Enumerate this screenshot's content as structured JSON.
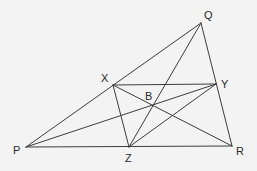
{
  "diagram": {
    "type": "geometry",
    "background": "#f3f3f3",
    "line_color": "#3c3c3c",
    "points": {
      "P": {
        "label": "P",
        "x": 26,
        "y": 147,
        "label_x": 13,
        "label_y": 145
      },
      "Q": {
        "label": "Q",
        "x": 201,
        "y": 23,
        "label_x": 204,
        "label_y": 10
      },
      "R": {
        "label": "R",
        "x": 232,
        "y": 146,
        "label_x": 236,
        "label_y": 146
      },
      "X": {
        "label": "X",
        "x": 113,
        "y": 85,
        "label_x": 101,
        "label_y": 73
      },
      "Y": {
        "label": "Y",
        "x": 216,
        "y": 84,
        "label_x": 221,
        "label_y": 79
      },
      "Z": {
        "label": "Z",
        "x": 129,
        "y": 147,
        "label_x": 125,
        "label_y": 153
      },
      "B": {
        "label": "B",
        "x": 153,
        "y": 106,
        "label_x": 145,
        "label_y": 91
      }
    },
    "segments": [
      [
        "P",
        "Q"
      ],
      [
        "Q",
        "R"
      ],
      [
        "P",
        "R"
      ],
      [
        "X",
        "Y"
      ],
      [
        "X",
        "Z"
      ],
      [
        "Y",
        "Z"
      ],
      [
        "P",
        "Y"
      ],
      [
        "Q",
        "Z"
      ],
      [
        "X",
        "R"
      ]
    ]
  }
}
